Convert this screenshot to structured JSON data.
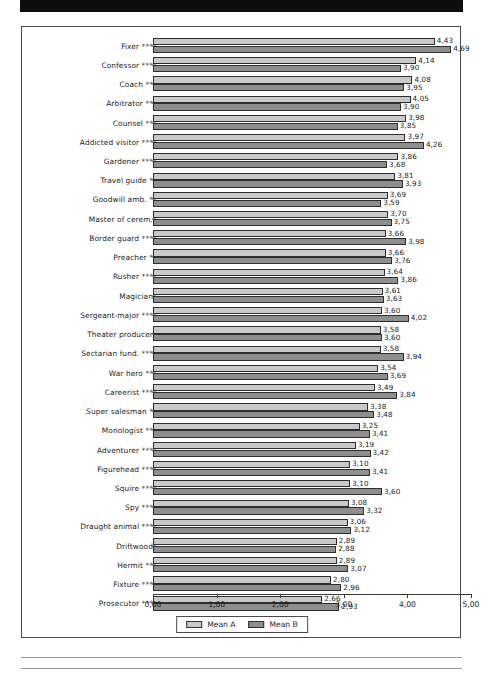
{
  "banner": {
    "name": "top-black-bar",
    "color": "#0d0d0d"
  },
  "legend": {
    "position": "bottom-center",
    "items": [
      {
        "label": "Mean A",
        "color": "#c9c9c9"
      },
      {
        "label": "Mean B",
        "color": "#8e8e8e"
      }
    ]
  },
  "axis": {
    "ticks": [
      "0,00",
      "1,00",
      "2,00",
      "3,00",
      "4,00",
      "5,00"
    ],
    "tick_values": [
      0,
      1,
      2,
      3,
      4,
      5
    ]
  },
  "chart_data": {
    "type": "bar",
    "orientation": "horizontal",
    "title": "",
    "xlabel": "",
    "ylabel": "",
    "xlim": [
      0,
      5
    ],
    "grid": false,
    "legend_position": "bottom-center",
    "decimal_separator": ",",
    "categories": [
      "Fixer ***",
      "Confessor ***",
      "Coach **",
      "Arbitrator **",
      "Counsel **",
      "Addicted visitor ***",
      "Gardener ***",
      "Travel guide *",
      "Goodwill amb. *",
      "Master of cerem.",
      "Border guard ***",
      "Preacher *",
      "Rusher ***",
      "Magician",
      "Sergeant-major ***",
      "Theater producer",
      "Sectarian fund. ***",
      "War hero **",
      "Careerist ***",
      "Super salesman *",
      "Monologist **",
      "Adventurer ***",
      "Figurehead ***",
      "Squire ***",
      "Spy ***",
      "Draught animal ***",
      "Driftwood",
      "Hermit **",
      "Fixture ***",
      "Prosecutor ***"
    ],
    "series": [
      {
        "name": "Mean A",
        "color": "#c9c9c9",
        "values": [
          4.43,
          4.14,
          4.08,
          4.05,
          3.98,
          3.97,
          3.86,
          3.81,
          3.69,
          3.7,
          3.66,
          3.66,
          3.64,
          3.61,
          3.6,
          3.58,
          3.58,
          3.54,
          3.49,
          3.38,
          3.25,
          3.19,
          3.1,
          3.1,
          3.08,
          3.06,
          2.89,
          2.89,
          2.8,
          2.66
        ],
        "labels": [
          "4,43",
          "4,14",
          "4,08",
          "4,05",
          "3,98",
          "3,97",
          "3,86",
          "3,81",
          "3,69",
          "3,70",
          "3,66",
          "3,66",
          "3,64",
          "3,61",
          "3,60",
          "3,58",
          "3,58",
          "3,54",
          "3,49",
          "3,38",
          "3,25",
          "3,19",
          "3,10",
          "3,10",
          "3,08",
          "3,06",
          "2,89",
          "2,89",
          "2,80",
          "2,66"
        ]
      },
      {
        "name": "Mean B",
        "color": "#8e8e8e",
        "values": [
          4.69,
          3.9,
          3.95,
          3.9,
          3.85,
          4.26,
          3.68,
          3.93,
          3.59,
          3.75,
          3.98,
          3.76,
          3.86,
          3.63,
          4.02,
          3.6,
          3.94,
          3.69,
          3.84,
          3.48,
          3.41,
          3.42,
          3.41,
          3.6,
          3.32,
          3.12,
          2.88,
          3.07,
          2.96,
          2.93
        ],
        "labels": [
          "4,69",
          "3,90",
          "3,95",
          "3,90",
          "3,85",
          "4,26",
          "3,68",
          "3,93",
          "3,59",
          "3,75",
          "3,98",
          "3,76",
          "3,86",
          "3,63",
          "4,02",
          "3,60",
          "3,94",
          "3,69",
          "3,84",
          "3,48",
          "3,41",
          "3,42",
          "3,41",
          "3,60",
          "3,32",
          "3,12",
          "2,88",
          "3,07",
          "2,96",
          "2,93"
        ]
      }
    ]
  }
}
